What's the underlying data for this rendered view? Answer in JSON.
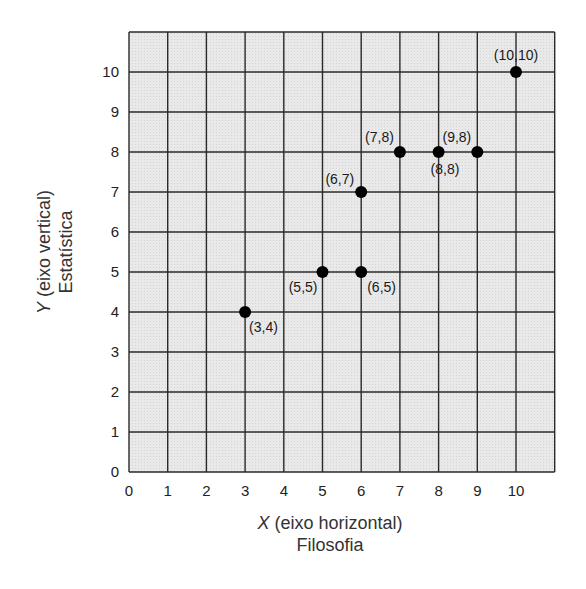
{
  "chart_data": {
    "type": "scatter",
    "title": "",
    "xlabel": "X (eixo horizontal)",
    "xlabel_sub": "Filosofia",
    "ylabel": "Y (eixo vertical)",
    "ylabel_sub": "Estatística",
    "xlim": [
      0,
      11
    ],
    "ylim": [
      0,
      11
    ],
    "x_ticks": [
      0,
      1,
      2,
      3,
      4,
      5,
      6,
      7,
      8,
      9,
      10
    ],
    "y_ticks": [
      0,
      1,
      2,
      3,
      4,
      5,
      6,
      7,
      8,
      9,
      10
    ],
    "grid": true,
    "series": [
      {
        "name": "pontos",
        "points": [
          {
            "x": 3,
            "y": 4,
            "label": "(3,4)"
          },
          {
            "x": 5,
            "y": 5,
            "label": "(5,5)"
          },
          {
            "x": 6,
            "y": 5,
            "label": "(6,5)"
          },
          {
            "x": 6,
            "y": 7,
            "label": "(6,7)"
          },
          {
            "x": 7,
            "y": 8,
            "label": "(7,8)"
          },
          {
            "x": 8,
            "y": 8,
            "label": "(8,8)"
          },
          {
            "x": 9,
            "y": 8,
            "label": "(9,8)"
          },
          {
            "x": 10,
            "y": 10,
            "label": "(10,10)"
          }
        ]
      }
    ]
  },
  "axes": {
    "x_var": "X",
    "x_desc": " (eixo horizontal)",
    "x_sub": "Filosofia",
    "y_var": "Y",
    "y_desc": " (eixo vertical)",
    "y_sub": "Estatística"
  },
  "style": {
    "grid_bg": "#e6e6e6",
    "grid_line": "#2a2a2a",
    "point_color": "#000000"
  }
}
